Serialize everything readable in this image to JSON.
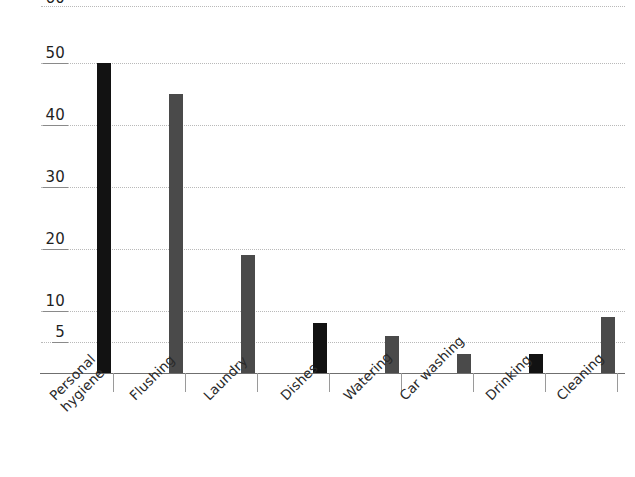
{
  "chart_data": {
    "type": "bar",
    "title": "",
    "subtitle": "",
    "xlabel": "",
    "ylabel": "",
    "categories": [
      "Personal\nhygiene",
      "Flushing",
      "Laundry",
      "Dishes",
      "Watering",
      "Car washing",
      "Drinking",
      "Cleaning"
    ],
    "values": [
      50,
      45,
      19,
      8,
      6,
      3,
      3,
      9
    ],
    "bar_colors": [
      "#121212",
      "#4a4a4a",
      "#4a4a4a",
      "#121212",
      "#4a4a4a",
      "#4a4a4a",
      "#121212",
      "#4a4a4a"
    ],
    "ylim": [
      0,
      60
    ],
    "ytick_labels": [
      "60",
      "50",
      "40",
      "30",
      "20",
      "10",
      "5"
    ],
    "ytick_values": [
      60,
      50,
      40,
      30,
      20,
      10,
      5
    ],
    "grid": true,
    "grid_color": "#b9b9b9",
    "axis_color": "#6f6f6f",
    "legend": "none",
    "background": "#ffffff"
  }
}
